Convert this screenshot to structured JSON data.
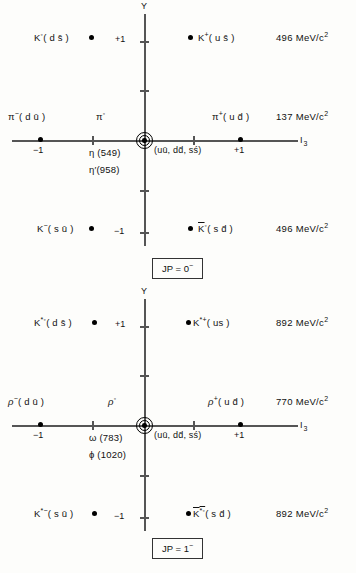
{
  "figure": {
    "axes": {
      "y_label": "Y",
      "i3_label": "I",
      "i3_sub": "3"
    }
  },
  "nonets": [
    {
      "id": "pseudoscalar",
      "jp_label": "JP = 0",
      "jp_sup": "−",
      "axis_ticks": {
        "y_plus1": "+1",
        "y_minus1": "−1",
        "i3_plus1": "+1",
        "i3_minus1": "−1"
      },
      "center_label": "(uū, dd̄, sś)",
      "rows": [
        {
          "y": "+1",
          "mass": "496 MeV/c",
          "mass_exp": "2",
          "left": {
            "symbol": "K",
            "sup": "◦",
            "quarks": "( d s̄ )"
          },
          "right": {
            "symbol": "K",
            "sup": "+",
            "quarks": "( u s̄ )"
          }
        },
        {
          "y": "0",
          "mass": "137 MeV/c",
          "mass_exp": "2",
          "left": {
            "symbol": "π",
            "sup": "−",
            "quarks": "( d ū )"
          },
          "center": {
            "symbol": "π",
            "sup": "◦",
            "quarks": ""
          },
          "right": {
            "symbol": "π",
            "sup": "+",
            "quarks": "( u d̄ )"
          },
          "neutrals": [
            "η (549)",
            "η′(958)"
          ]
        },
        {
          "y": "−1",
          "mass": "496 MeV/c",
          "mass_exp": "2",
          "left": {
            "symbol": "K",
            "sup": "−",
            "quarks": "( s ū )"
          },
          "right": {
            "symbol": "K",
            "sup": "◦",
            "quarks": "( s d̄ )",
            "bar": true
          }
        }
      ]
    },
    {
      "id": "vector",
      "jp_label": "JP = 1",
      "jp_sup": "−",
      "axis_ticks": {
        "y_plus1": "+1",
        "y_minus1": "−1",
        "i3_plus1": "+1",
        "i3_minus1": "−1"
      },
      "center_label": "(uū, dd̄, sś)",
      "rows": [
        {
          "y": "+1",
          "mass": "892 MeV/c",
          "mass_exp": "2",
          "left": {
            "symbol": "K",
            "sup": "*◦",
            "quarks": "( d s̄ )"
          },
          "right": {
            "symbol": "K",
            "sup": "*+",
            "quarks": "( us )"
          }
        },
        {
          "y": "0",
          "mass": "770 MeV/c",
          "mass_exp": "2",
          "left": {
            "symbol": "ρ",
            "sup": "−",
            "quarks": "( d ū )"
          },
          "center": {
            "symbol": "ρ",
            "sup": "◦",
            "quarks": ""
          },
          "right": {
            "symbol": "ρ",
            "sup": "+",
            "quarks": "( u d̄ )"
          },
          "neutrals": [
            "ω (783)",
            "ϕ (1020)"
          ]
        },
        {
          "y": "−1",
          "mass": "892 MeV/c",
          "mass_exp": "2",
          "left": {
            "symbol": "K",
            "sup": "*−",
            "quarks": "( s ū )"
          },
          "right": {
            "symbol": "K",
            "sup": "*◦",
            "quarks": "( s d̄ )",
            "bar": true
          }
        }
      ]
    }
  ]
}
